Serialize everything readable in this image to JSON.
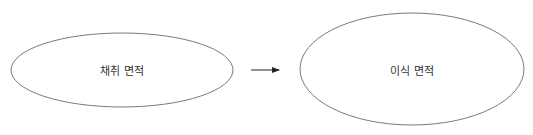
{
  "diagram": {
    "type": "flow",
    "nodes": [
      {
        "id": "harvest",
        "label": "채취 면적",
        "shape": "ellipse",
        "cx": 122,
        "cy": 70,
        "rx": 111,
        "ry": 37
      },
      {
        "id": "transplant",
        "label": "이식 면적",
        "shape": "ellipse",
        "cx": 412,
        "cy": 69,
        "rx": 112,
        "ry": 56
      }
    ],
    "edges": [
      {
        "from": "harvest",
        "to": "transplant",
        "style": "solid-arrow"
      }
    ],
    "colors": {
      "stroke": "#7a7a7a",
      "arrow": "#222222",
      "text": "#333333",
      "background": "#ffffff"
    }
  }
}
